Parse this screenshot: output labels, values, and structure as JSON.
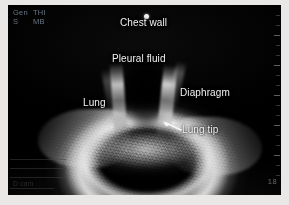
{
  "modality": "thoracic-ultrasound",
  "frame": {
    "border_color": "#e9e8e6",
    "canvas_color": "#000000"
  },
  "preset": {
    "mode_label": "Gen",
    "harmonic_label": "THI",
    "sub_label": "S",
    "beam_label": "MB",
    "text_color": "#6d7c8c"
  },
  "annotations": {
    "label_color": "#f2f2f2",
    "items": [
      {
        "id": "chest-wall",
        "text": "Chest wall",
        "marker": "dot"
      },
      {
        "id": "pleural-fluid",
        "text": "Pleural fluid",
        "marker": "none"
      },
      {
        "id": "diaphragm",
        "text": "Diaphragm",
        "marker": "none"
      },
      {
        "id": "lung",
        "text": "Lung",
        "marker": "none"
      },
      {
        "id": "lung-tip",
        "text": "Lung tip",
        "marker": "arrow"
      }
    ]
  },
  "panel": {
    "line1": "",
    "line2": "",
    "line3": "D cam",
    "text_color": "#2b2b2b"
  },
  "scale": {
    "depth_marker": "18",
    "tick_color": "#969696"
  }
}
